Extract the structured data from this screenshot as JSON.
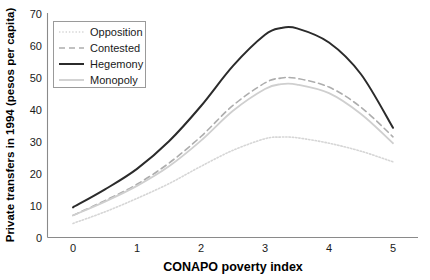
{
  "chart_data": {
    "type": "line",
    "title": "",
    "xlabel": "CONAPO poverty index",
    "ylabel": "Private transfers in 1994 (pesos per capita)",
    "xlim": [
      0,
      5
    ],
    "ylim": [
      0,
      70
    ],
    "xticks": [
      "0",
      "1",
      "2",
      "3",
      "4",
      "5"
    ],
    "yticks": [
      "0",
      "10",
      "20",
      "30",
      "40",
      "50",
      "60",
      "70"
    ],
    "grid": false,
    "legend_position": "upper left",
    "x": [
      0,
      0.5,
      1,
      1.5,
      2,
      2.5,
      3,
      3.25,
      3.5,
      4,
      4.5,
      5
    ],
    "series": [
      {
        "name": "Opposition",
        "style": "dotted",
        "color": "#d6d6d6",
        "values": [
          4.4,
          8.0,
          12.2,
          16.8,
          22.2,
          27.2,
          30.8,
          31.3,
          31.1,
          29.4,
          26.9,
          23.6
        ]
      },
      {
        "name": "Contested",
        "style": "dashed",
        "color": "#adadad",
        "values": [
          6.9,
          11.5,
          16.6,
          23.2,
          31.5,
          41.2,
          48.2,
          49.7,
          49.6,
          46.9,
          40.6,
          31.4
        ]
      },
      {
        "name": "Hegemony",
        "style": "solid",
        "color": "#2b2b2b",
        "values": [
          9.4,
          15.0,
          21.4,
          30.0,
          41.0,
          53.5,
          63.2,
          65.3,
          65.2,
          60.8,
          50.9,
          34.2
        ]
      },
      {
        "name": "Monopoly",
        "style": "solid",
        "color": "#cfcfcf",
        "values": [
          6.9,
          11.2,
          16.1,
          22.2,
          30.2,
          39.5,
          46.3,
          47.8,
          47.7,
          45.0,
          38.5,
          29.4
        ]
      }
    ]
  },
  "legend": {
    "items": [
      {
        "label": "Opposition"
      },
      {
        "label": "Contested"
      },
      {
        "label": "Hegemony"
      },
      {
        "label": "Monopoly"
      }
    ]
  }
}
